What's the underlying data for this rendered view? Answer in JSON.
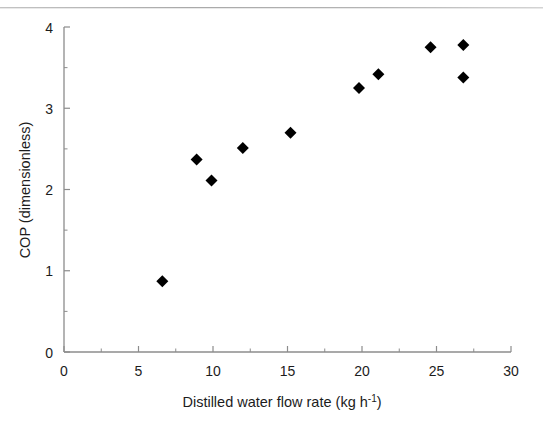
{
  "chart_data": {
    "type": "scatter",
    "title": "",
    "xlabel": "Distilled water flow rate (kg h-1)",
    "xlabel_main": "Distilled water flow rate (kg h",
    "xlabel_sup": "-1",
    "xlabel_tail": ")",
    "ylabel": "COP (dimensionless)",
    "xlim": [
      0,
      30
    ],
    "ylim": [
      0,
      4
    ],
    "xticks": [
      0,
      5,
      10,
      15,
      20,
      25,
      30
    ],
    "xtick_labels": [
      "0",
      "5",
      "10",
      "15",
      "20",
      "25",
      "30"
    ],
    "yticks": [
      0,
      1,
      2,
      3,
      4
    ],
    "ytick_labels": [
      "0",
      "1",
      "2",
      "3",
      "4"
    ],
    "x_minor_ticks": [
      2.5,
      7.5,
      12.5,
      17.5,
      22.5,
      27.5
    ],
    "y_minor_ticks": [
      0.5,
      1.5,
      2.5,
      3.5
    ],
    "grid": false,
    "legend": false,
    "marker": "diamond",
    "marker_color": "#000000",
    "marker_size": 6,
    "axis_color": "#8c8c8c",
    "series": [
      {
        "name": "COP vs distilled water flow rate",
        "points": [
          {
            "x": 6.6,
            "y": 0.87
          },
          {
            "x": 8.9,
            "y": 2.37
          },
          {
            "x": 9.9,
            "y": 2.11
          },
          {
            "x": 12.0,
            "y": 2.51
          },
          {
            "x": 15.2,
            "y": 2.7
          },
          {
            "x": 19.8,
            "y": 3.25
          },
          {
            "x": 21.1,
            "y": 3.42
          },
          {
            "x": 24.6,
            "y": 3.75
          },
          {
            "x": 26.8,
            "y": 3.78
          },
          {
            "x": 26.8,
            "y": 3.38
          }
        ]
      }
    ]
  }
}
